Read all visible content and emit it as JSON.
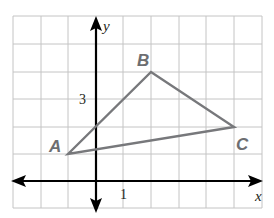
{
  "graph": {
    "axes": {
      "x_label": "x",
      "y_label": "y"
    },
    "tick_labels": {
      "x": "1",
      "y": "3"
    },
    "grid": {
      "x_min": -3,
      "x_max": 6,
      "y_min": -1,
      "y_max": 6
    },
    "points": [
      {
        "name": "A",
        "x": -1,
        "y": 1
      },
      {
        "name": "B",
        "x": 2,
        "y": 4
      },
      {
        "name": "C",
        "x": 5,
        "y": 2
      }
    ],
    "colors": {
      "grid": "#bfbfbf",
      "axis": "#000000",
      "triangle": "#77787b",
      "label": "#6d6e71"
    }
  }
}
